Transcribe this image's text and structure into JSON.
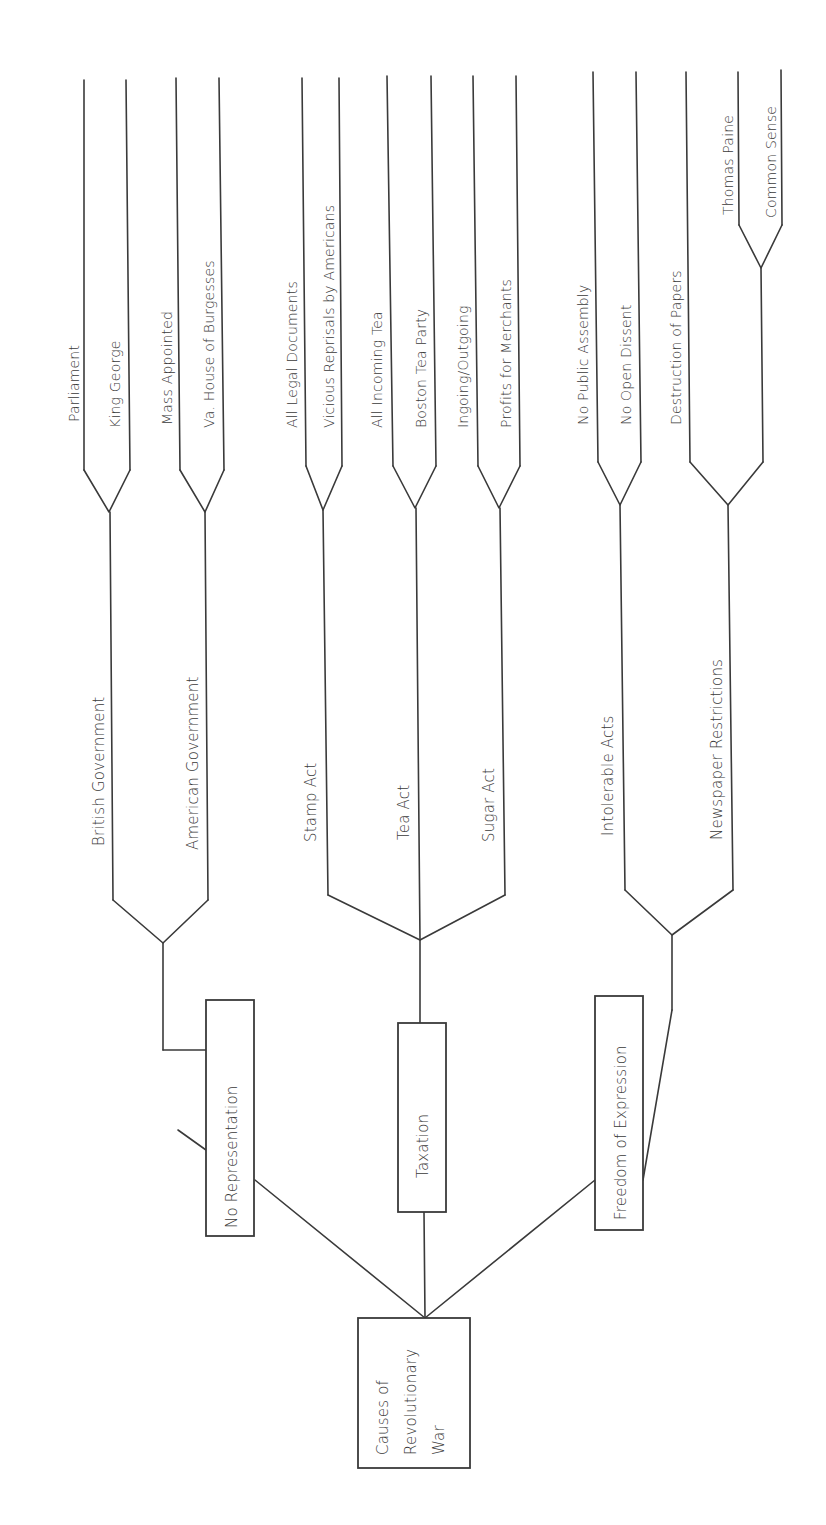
{
  "diagram": {
    "type": "tree",
    "orientation": "rotated-90-ccw",
    "root": {
      "label_lines": [
        "Causes of",
        "Revolutionary",
        "War"
      ]
    },
    "categories": [
      {
        "label": "No Representation",
        "branches": [
          {
            "label": "British Government",
            "leaves": [
              "Parliament",
              "King George"
            ]
          },
          {
            "label": "American Government",
            "leaves": [
              "Mass Appointed",
              "Va. House of Burgesses"
            ]
          }
        ]
      },
      {
        "label": "Taxation",
        "branches": [
          {
            "label": "Stamp Act",
            "leaves": [
              "All Legal Documents",
              "Vicious Reprisals by Americans"
            ]
          },
          {
            "label": "Tea Act",
            "leaves": [
              "All Incoming Tea",
              "Boston Tea Party"
            ]
          },
          {
            "label": "Sugar Act",
            "leaves": [
              "Ingoing/Outgoing",
              "Profits for Merchants"
            ]
          }
        ]
      },
      {
        "label": "Freedom of Expression",
        "branches": [
          {
            "label": "Intolerable Acts",
            "leaves": [
              "No Public Assembly",
              "No Open Dissent"
            ]
          },
          {
            "label": "Newspaper Restrictions",
            "leaves": [
              "Destruction of Papers"
            ],
            "sub_branch": {
              "leaves": [
                "Thomas Paine",
                "Common Sense"
              ]
            }
          }
        ]
      }
    ]
  },
  "colors": {
    "line": "#3a3a3a",
    "background": "#ffffff"
  }
}
